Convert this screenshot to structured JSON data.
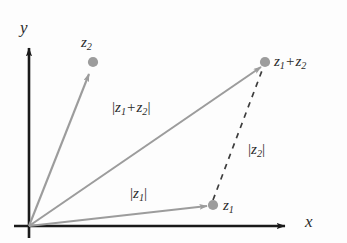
{
  "figure": {
    "background_color": "#fdfdfd",
    "axes": {
      "x_label": "x",
      "y_label": "y",
      "axis_color": "#1a1a1a",
      "origin": {
        "x": 29,
        "y": 226
      }
    },
    "vector_color": "#999999",
    "point_color": "#9a9a9a",
    "dashed_color": "#3a3a3a",
    "points": [
      {
        "id": "z2",
        "label_a": "z",
        "label_sub": "2",
        "x": 93,
        "y": 62
      },
      {
        "id": "z1",
        "label_a": "z",
        "label_sub": "1",
        "x": 213,
        "y": 205
      },
      {
        "id": "z1plusz2",
        "label_a": "z",
        "label_sub": "1",
        "label_op": "+",
        "label_b": "z",
        "label_b_sub": "2",
        "x": 265,
        "y": 62
      }
    ],
    "labels": {
      "y_axis": "y",
      "x_axis": "x",
      "point_z2": {
        "base": "z",
        "sub": "2"
      },
      "point_z1": {
        "base": "z",
        "sub": "1"
      },
      "point_sum": {
        "base1": "z",
        "sub1": "1",
        "op": "+",
        "base2": "z",
        "sub2": "2"
      },
      "mag_z1": {
        "bar": "|",
        "base": "z",
        "sub": "1"
      },
      "mag_z2": {
        "bar": "|",
        "base": "z",
        "sub": "2"
      },
      "mag_sum": {
        "bar": "|",
        "base1": "z",
        "sub1": "1",
        "op": "+",
        "base2": "z",
        "sub2": "2"
      }
    },
    "vectors": [
      {
        "id": "vector-z2",
        "from": [
          29,
          226
        ],
        "to": [
          90,
          72
        ],
        "label": "z2-vector"
      },
      {
        "id": "vector-z1",
        "from": [
          29,
          226
        ],
        "to": [
          209,
          206
        ],
        "label": "z1-vector"
      },
      {
        "id": "vector-sum",
        "from": [
          29,
          226
        ],
        "to": [
          262,
          66
        ],
        "label": "sum-vector"
      }
    ],
    "dashed_segment": {
      "id": "dashed-z2-translate",
      "from": [
        213,
        203
      ],
      "to": [
        264,
        67
      ]
    }
  }
}
